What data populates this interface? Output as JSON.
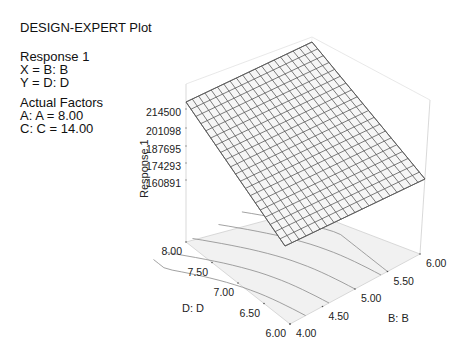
{
  "header": {
    "title": "DESIGN-EXPERT Plot",
    "response": "Response 1",
    "x_line": "X = B: B",
    "y_line": "Y = D: D",
    "actual_factors_title": "Actual Factors",
    "factor_a": "A: A = 8.00",
    "factor_c": "C: C = 14.00"
  },
  "chart_data": {
    "type": "surface3d",
    "title": "DESIGN-EXPERT Plot",
    "zlabel": "Response 1",
    "xlabel": "B: B",
    "ylabel": "D: D",
    "z_ticks": [
      "160891",
      "174293",
      "187695",
      "201098",
      "214500"
    ],
    "x_ticks": [
      "4.00",
      "4.50",
      "5.00",
      "5.50",
      "6.00"
    ],
    "y_ticks": [
      "6.00",
      "6.50",
      "7.00",
      "7.50",
      "8.00"
    ],
    "xlim": [
      4.0,
      6.0
    ],
    "ylim": [
      6.0,
      8.0
    ],
    "zlim": [
      160891,
      214500
    ],
    "grid_resolution": 20,
    "surface_corners": [
      {
        "B": 4.0,
        "D": 8.0,
        "response_approx": 190000
      },
      {
        "B": 6.0,
        "D": 8.0,
        "response_approx": 214500
      },
      {
        "B": 6.0,
        "D": 6.0,
        "response_approx": 172000
      },
      {
        "B": 4.0,
        "D": 6.0,
        "response_approx": 150000
      }
    ],
    "floor_contours": true,
    "fixed_factors": {
      "A": 8.0,
      "C": 14.0
    }
  }
}
